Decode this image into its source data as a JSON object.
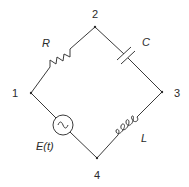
{
  "diagram": {
    "type": "RLC circuit (bridge-shaped loop)",
    "nodes": [
      {
        "id": "1",
        "label": "1",
        "x": 31,
        "y": 93
      },
      {
        "id": "2",
        "label": "2",
        "x": 95,
        "y": 27
      },
      {
        "id": "3",
        "label": "3",
        "x": 162,
        "y": 92
      },
      {
        "id": "4",
        "label": "4",
        "x": 97,
        "y": 158
      }
    ],
    "components": [
      {
        "id": "R",
        "kind": "resistor",
        "label": "R",
        "between": [
          "1",
          "2"
        ]
      },
      {
        "id": "C",
        "kind": "capacitor",
        "label": "C",
        "between": [
          "2",
          "3"
        ]
      },
      {
        "id": "L",
        "kind": "inductor",
        "label": "L",
        "between": [
          "3",
          "4"
        ]
      },
      {
        "id": "E",
        "kind": "ac-voltage-source",
        "label": "E(t)",
        "symbol": "~",
        "between": [
          "4",
          "1"
        ]
      }
    ],
    "colors": {
      "line": "#3a3a3a",
      "text": "#2a2a2a",
      "background": "#ffffff"
    }
  }
}
